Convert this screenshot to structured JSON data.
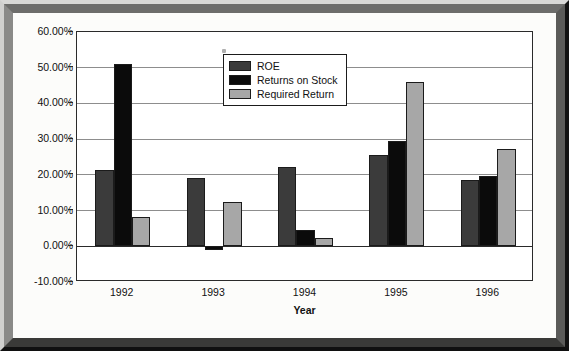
{
  "chart_data": {
    "type": "bar",
    "title": "",
    "xlabel": "Year",
    "ylabel": "",
    "categories": [
      "1992",
      "1993",
      "1994",
      "1995",
      "1996"
    ],
    "series": [
      {
        "name": "ROE",
        "color": "#3b3b3b",
        "values": [
          21.5,
          19.2,
          22.3,
          25.5,
          18.6
        ]
      },
      {
        "name": "Returns on Stock",
        "color": "#0b0b0b",
        "values": [
          51.1,
          -1.0,
          4.5,
          29.4,
          19.6
        ]
      },
      {
        "name": "Required Return",
        "color": "#a7a7a7",
        "values": [
          8.2,
          12.3,
          2.2,
          46.1,
          27.2
        ]
      }
    ],
    "ylim": [
      -10,
      60
    ],
    "ytick_values": [
      60,
      50,
      40,
      30,
      20,
      10,
      0,
      -10
    ],
    "ytick_labels": [
      "60.00%",
      "50.00%",
      "40.00%",
      "30.00%",
      "20.00%",
      "10.00%",
      "0.00%",
      "-10.00%"
    ],
    "grid": true,
    "legend_position": "top-center-right",
    "value_suffix": "%"
  },
  "legend": {
    "entries": [
      {
        "label": "ROE"
      },
      {
        "label": "Returns on Stock"
      },
      {
        "label": "Required Return"
      }
    ]
  },
  "axes": {
    "x_title": "Year"
  }
}
